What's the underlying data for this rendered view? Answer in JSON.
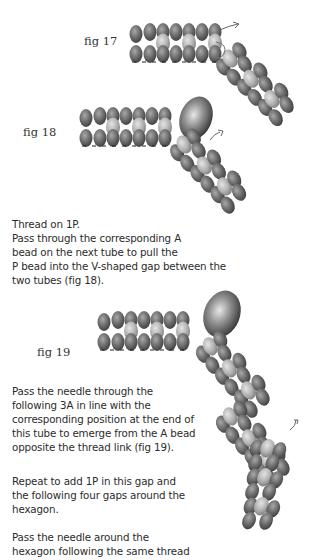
{
  "figures": [
    {
      "id": "fig17",
      "label": "fig 17"
    },
    {
      "id": "fig18",
      "label": "fig 18"
    },
    {
      "id": "fig19",
      "label": "fig 19"
    }
  ],
  "paragraphs": [
    {
      "lines": [
        "Thread on 1P.",
        "Pass through the corresponding A",
        "bead on the next tube to pull the",
        "P bead into the V-shaped gap between the",
        "two tubes (fig 18)."
      ]
    },
    {
      "lines": [
        "Pass the needle through the",
        "following 3A in line with the",
        "corresponding position at the end of",
        "this tube to emerge from the A bead",
        "opposite the thread link (fig 19)."
      ]
    },
    {
      "lines": [
        "Repeat to add 1P in this gap and",
        "the following four gaps around the",
        "hexagon."
      ]
    },
    {
      "lines": [
        "Pass the needle around the",
        "hexagon following the same thread"
      ]
    }
  ],
  "colors": {
    "bead_dark": "#5a5a5a",
    "bead_mid": "#8a8a8a",
    "bead_light": "#c4c4c4",
    "pearl": "#6e6e6e",
    "text": "#2b2b2b"
  }
}
